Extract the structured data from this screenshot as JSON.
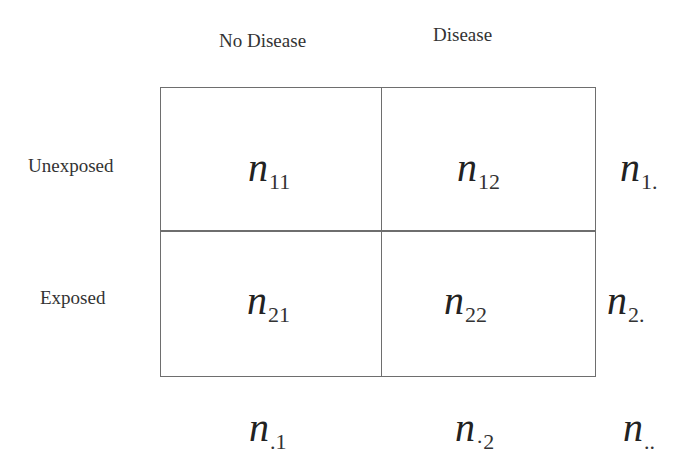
{
  "column_headers": [
    "No Disease",
    "Disease"
  ],
  "row_headers": [
    "Unexposed",
    "Exposed"
  ],
  "cells": [
    [
      {
        "symbol": "n",
        "subscript": "11"
      },
      {
        "symbol": "n",
        "subscript": "12"
      }
    ],
    [
      {
        "symbol": "n",
        "subscript": "21"
      },
      {
        "symbol": "n",
        "subscript": "22"
      }
    ]
  ],
  "row_totals": [
    {
      "symbol": "n",
      "subscript": "1."
    },
    {
      "symbol": "n",
      "subscript": "2."
    }
  ],
  "column_totals": [
    {
      "symbol": "n",
      "subscript": ".1"
    },
    {
      "symbol": "n",
      "subscript": "·2"
    }
  ],
  "grand_total": {
    "symbol": "n",
    "subscript": ".."
  }
}
